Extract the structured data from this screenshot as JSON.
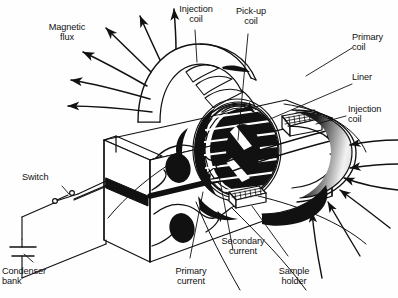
{
  "figure": {
    "kind": "technical-line-diagram",
    "title_text": "",
    "background_color": "#ffffff",
    "ink_color": "#111111"
  },
  "labels": {
    "magnetic_flux": "Magnetic\nflux",
    "injection_coil_top": "Injection\ncoil",
    "pickup_coil": "Pick-up\ncoil",
    "primary_coil": "Primary\ncoil",
    "liner": "Liner",
    "injection_coil_right": "Injection\ncoil",
    "switch": "Switch",
    "condenser_bank": "Condenser\nbank",
    "primary_current": "Primary\ncurrent",
    "secondary_current": "Secondary\ncurrent",
    "sample_holder": "Sample\nholder"
  },
  "components": {
    "slab": "primary-coil-slab",
    "holes": 2,
    "slab_gap": "horizontal-slot",
    "top_arch": "injection-coil-arch",
    "right_torus": "injection-coil-torus",
    "center_assembly": "pickup-coil-liner-assembly",
    "sample_holder_block": "hatched-sample-holder",
    "circuit": "condenser-bank-and-switch"
  },
  "flux_arrows": {
    "left_outward_count": 6,
    "right_inward_count": 6,
    "direction_left": "outward",
    "direction_right": "inward"
  }
}
